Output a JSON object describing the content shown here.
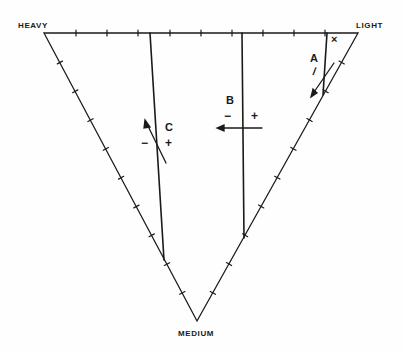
{
  "diagram": {
    "type": "ternary-triangle",
    "vertices": {
      "top_left": "HEAVY",
      "top_right": "LIGHT",
      "bottom": "MEDIUM"
    },
    "ticks_per_side": 9,
    "cut_lines": [
      {
        "label": "A",
        "minus": "/",
        "plus": "×",
        "arrow_direction": "down-left"
      },
      {
        "label": "B",
        "minus": "−",
        "plus": "+",
        "arrow_direction": "left"
      },
      {
        "label": "C",
        "minus": "−",
        "plus": "+",
        "arrow_direction": "up-left"
      }
    ],
    "colors": {
      "line": "#1a1a1a",
      "background": "#fefefe"
    }
  }
}
